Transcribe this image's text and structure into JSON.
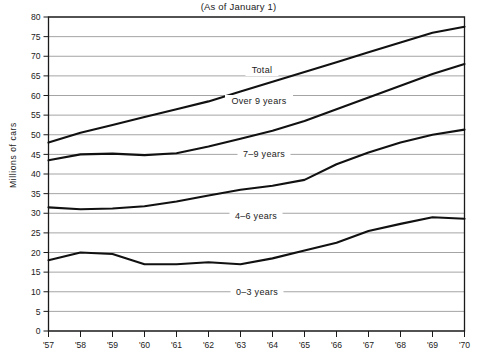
{
  "chart_data": {
    "type": "line",
    "title": "(As of January 1)",
    "xlabel": "",
    "ylabel": "Millions of cars",
    "ylim": [
      0,
      80
    ],
    "ytick_step": 5,
    "grid": true,
    "legend_position": "inline-on-curve",
    "x": [
      "'57",
      "'58",
      "'59",
      "'60",
      "'61",
      "'62",
      "'63",
      "'64",
      "'65",
      "'66",
      "'67",
      "'68",
      "'69",
      "'70"
    ],
    "yticks": [
      "0",
      "5",
      "10",
      "15",
      "20",
      "25",
      "30",
      "35",
      "40",
      "45",
      "50",
      "55",
      "60",
      "65",
      "70",
      "75",
      "80"
    ],
    "series": [
      {
        "name": "Total",
        "values": [
          48.0,
          50.5,
          52.5,
          54.5,
          56.5,
          58.5,
          61.0,
          63.5,
          66.0,
          68.5,
          71.0,
          73.5,
          76.0,
          77.5
        ]
      },
      {
        "name": "Over 9 years",
        "values": [
          43.5,
          45.0,
          45.2,
          44.8,
          45.3,
          47.0,
          49.0,
          51.0,
          53.5,
          56.5,
          59.5,
          62.5,
          65.5,
          68.0
        ]
      },
      {
        "name": "7-9 years",
        "values": [
          31.5,
          31.0,
          31.2,
          31.8,
          33.0,
          34.5,
          36.0,
          37.0,
          38.5,
          42.5,
          45.5,
          48.0,
          50.0,
          51.3
        ]
      },
      {
        "name": "4-6 years",
        "values": [
          31.5,
          31.0,
          31.2,
          31.8,
          33.0,
          34.5,
          36.0,
          37.0,
          38.5,
          42.5,
          45.5,
          48.0,
          50.0,
          51.3
        ]
      },
      {
        "name": "0-3 years",
        "values": [
          18.0,
          20.0,
          19.6,
          17.0,
          17.0,
          17.5,
          17.0,
          18.5,
          20.5,
          22.5,
          25.5,
          27.3,
          29.0,
          28.6
        ]
      }
    ],
    "series_labels": [
      {
        "text": "Total",
        "series": "Total"
      },
      {
        "text": "Over 9 years",
        "series": "Over 9 years"
      },
      {
        "text": "7–9 years",
        "series": "7-9 years"
      },
      {
        "text": "4–6 years",
        "series": "4-6 years"
      },
      {
        "text": "0–3 years",
        "series": "0-3 years"
      }
    ]
  }
}
